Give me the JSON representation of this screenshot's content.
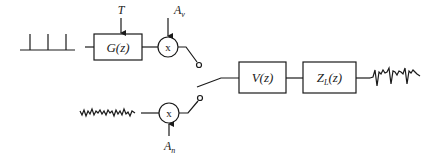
{
  "diagram": {
    "colors": {
      "stroke": "#1a1a1a",
      "background": "#ffffff"
    },
    "voiced_branch": {
      "source_icon": "impulse-train",
      "glottal_block": {
        "label": "G(z)"
      },
      "pitch_input": {
        "label": "T"
      },
      "multiplier": {
        "symbol": "x"
      },
      "gain_label_main": "A",
      "gain_label_sub": "v"
    },
    "unvoiced_branch": {
      "source_icon": "white-noise",
      "multiplier": {
        "symbol": "x"
      },
      "gain_label_main": "A",
      "gain_label_sub": "n"
    },
    "switch": {
      "icon": "switch",
      "position": "between voiced and unvoiced"
    },
    "vocal_tract_block": {
      "label": "V(z)"
    },
    "radiation_block": {
      "label_main": "Z",
      "label_sub": "L",
      "label_tail": "(z)"
    },
    "output": {
      "icon": "speech-waveform"
    }
  }
}
